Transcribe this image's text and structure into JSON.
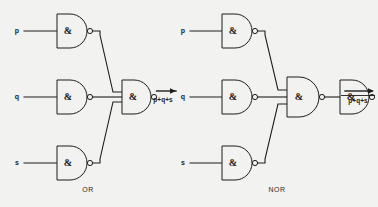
{
  "figure": {
    "background_color": "#f2f2f0",
    "line_color": "#1d1d1d",
    "gate_symbol": "&",
    "gate_standard": "IEC distinctive-shape NAND (D-body with inversion bubble)"
  },
  "circuits": [
    {
      "id": "or-circuit",
      "caption": "OR",
      "inputs": [
        {
          "name": "p",
          "label": "p"
        },
        {
          "name": "q",
          "label": "q"
        },
        {
          "name": "s",
          "label": "s"
        }
      ],
      "output": {
        "label": "p+q+s",
        "negated": false
      },
      "gates": [
        {
          "id": "or-inv-p",
          "symbol": "&",
          "role": "inverter",
          "inverted_output": true
        },
        {
          "id": "or-inv-q",
          "symbol": "&",
          "role": "inverter",
          "inverted_output": true
        },
        {
          "id": "or-inv-s",
          "symbol": "&",
          "role": "inverter",
          "inverted_output": true
        },
        {
          "id": "or-nand-3",
          "symbol": "&",
          "role": "nand-3-input",
          "inverted_output": true
        }
      ]
    },
    {
      "id": "nor-circuit",
      "caption": "NOR",
      "inputs": [
        {
          "name": "p",
          "label": "p"
        },
        {
          "name": "q",
          "label": "q"
        },
        {
          "name": "s",
          "label": "s"
        }
      ],
      "output": {
        "label": "p+q+s",
        "negated": true
      },
      "gates": [
        {
          "id": "nor-inv-p",
          "symbol": "&",
          "role": "inverter",
          "inverted_output": true
        },
        {
          "id": "nor-inv-q",
          "symbol": "&",
          "role": "inverter",
          "inverted_output": true
        },
        {
          "id": "nor-inv-s",
          "symbol": "&",
          "role": "inverter",
          "inverted_output": true
        },
        {
          "id": "nor-nand-3",
          "symbol": "&",
          "role": "nand-3-input",
          "inverted_output": true
        },
        {
          "id": "nor-inv-out",
          "symbol": "&",
          "role": "inverter",
          "inverted_output": true
        }
      ]
    }
  ]
}
